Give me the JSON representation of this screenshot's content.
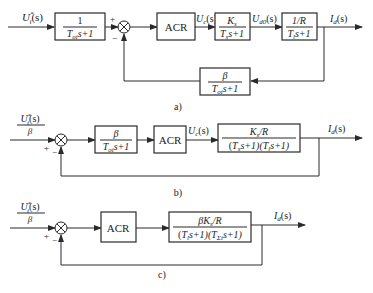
{
  "diagrams": [
    {
      "caption": "a)",
      "input_label": "U*i(s)",
      "blocks": [
        {
          "id": "input-filter",
          "numerator": "1",
          "denominator": "Toi s+1"
        },
        {
          "id": "acr",
          "text": "ACR"
        },
        {
          "id": "converter",
          "numerator": "Ks",
          "denominator": "Ts s+1"
        },
        {
          "id": "armature",
          "numerator": "1/R",
          "denominator": "Tl s+1"
        },
        {
          "id": "feedback-filter",
          "numerator": "β",
          "denominator": "Toi s+1"
        }
      ],
      "signals": {
        "uc": "Uc(s)",
        "ud0": "Ud0(s)",
        "output": "Id(s)"
      },
      "sum_signs": {
        "plus": "+",
        "minus": "−"
      }
    },
    {
      "caption": "b)",
      "input_label": {
        "numerator": "U*i(s)",
        "denominator": "β"
      },
      "blocks": [
        {
          "id": "beta-filter",
          "numerator": "β",
          "denominator": "Toi s+1"
        },
        {
          "id": "acr",
          "text": "ACR"
        },
        {
          "id": "plant",
          "numerator": "Ks/R",
          "denominator": "(Ts s+1)(Tl s+1)"
        }
      ],
      "signals": {
        "uc": "Uc(s)",
        "output": "Id(s)"
      },
      "sum_signs": {
        "plus": "+",
        "minus": "−"
      }
    },
    {
      "caption": "c)",
      "input_label": {
        "numerator": "U*i(s)",
        "denominator": "β"
      },
      "blocks": [
        {
          "id": "acr",
          "text": "ACR"
        },
        {
          "id": "plant",
          "numerator": "βKs/R",
          "denominator": "(Tl s+1)(TΣi s+1)"
        }
      ],
      "signals": {
        "output": "Id(s)"
      },
      "sum_signs": {
        "plus": "+",
        "minus": "−"
      }
    }
  ],
  "text": {
    "a_caption": "a)",
    "b_caption": "b)",
    "c_caption": "c)",
    "acr": "ACR",
    "one": "1",
    "beta": "β",
    "plus": "+",
    "minus": "−",
    "U": "U",
    "i": "i",
    "star": "*",
    "s_paren": "(s)",
    "c": "c",
    "d0": "d0",
    "d": "d",
    "I": "I",
    "T": "T",
    "oi": "oi",
    "s_plus_1": "s+1",
    "K": "K",
    "s_sub": "s",
    "slash_R": "/R",
    "one_over_R": "1/R",
    "l": "l",
    "paren_open": "(",
    "s_plus_1_close": "s+1)",
    "s_plus_1_paren": "s+1)(",
    "sigma_i": "Σi",
    "beta_K": "βK"
  }
}
